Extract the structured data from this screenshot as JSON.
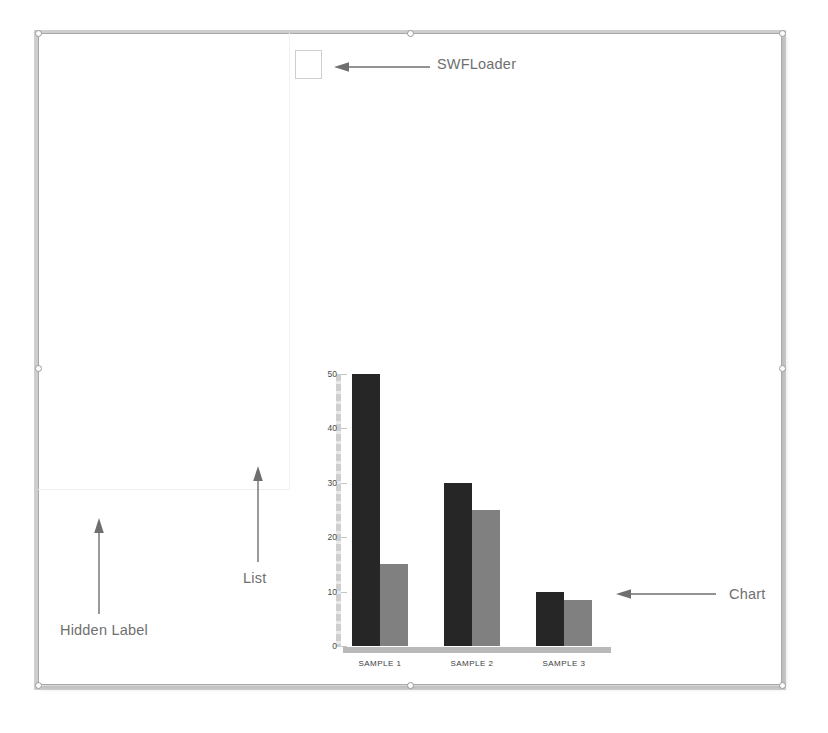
{
  "diagram": {
    "background_color": "#ffffff",
    "frame_border_color": "#a8a8a8"
  },
  "annotations": [
    {
      "id": "swfloader",
      "label": "SWFLoader",
      "arrow_direction": "left"
    },
    {
      "id": "chart",
      "label": "Chart",
      "arrow_direction": "left"
    },
    {
      "id": "list",
      "label": "List",
      "arrow_direction": "up"
    },
    {
      "id": "hidden",
      "label": "Hidden Label",
      "arrow_direction": "up"
    }
  ],
  "components": {
    "swfloader_box": {
      "name": "SWFLoader",
      "border_color": "#cfcfcf"
    },
    "list_region": {
      "name": "List"
    }
  },
  "chart_data": {
    "type": "bar",
    "title": "",
    "xlabel": "",
    "ylabel": "",
    "categories": [
      "SAMPLE 1",
      "SAMPLE 2",
      "SAMPLE 3"
    ],
    "series": [
      {
        "name": "Series 1",
        "color": "#262626",
        "values": [
          50,
          30,
          10
        ]
      },
      {
        "name": "Series 2",
        "color": "#808080",
        "values": [
          15,
          25,
          8.5
        ]
      }
    ],
    "ylim": [
      0,
      50
    ],
    "yticks": [
      0,
      10,
      20,
      30,
      40,
      50
    ],
    "ytick_labels": [
      "0",
      "10",
      "20",
      "30",
      "40",
      "50"
    ],
    "grid": false,
    "legend": "none",
    "axis_color": "#b9b9b9"
  },
  "selection_handles": [
    {
      "position": "top-left"
    },
    {
      "position": "top-center"
    },
    {
      "position": "top-right"
    },
    {
      "position": "middle-left"
    },
    {
      "position": "middle-right"
    },
    {
      "position": "bottom-left"
    },
    {
      "position": "bottom-center"
    },
    {
      "position": "bottom-right"
    }
  ]
}
